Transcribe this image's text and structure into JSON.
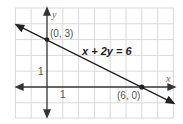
{
  "diagram": {
    "equation": "x + 2y = 6",
    "points": [
      {
        "label": "(0, 3)",
        "x": 0,
        "y": 3
      },
      {
        "label": "(6, 0)",
        "x": 6,
        "y": 0
      }
    ],
    "axis_labels": {
      "x": "x",
      "y": "y"
    },
    "tick_labels": {
      "x_unit": "1",
      "y_unit": "1"
    },
    "colors": {
      "grid": "#d9d9d9",
      "line": "#222222",
      "background": "#ffffff"
    }
  }
}
